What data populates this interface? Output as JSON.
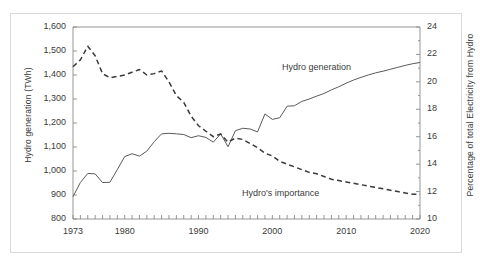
{
  "chart_data": {
    "type": "line",
    "title": "",
    "subtitle": "",
    "xlabel": "",
    "ylabel": "Hydro generation (TWh)",
    "ylabel_right": "Percentage of total Electricity from Hydro",
    "xlim": [
      1973,
      2020
    ],
    "ylim": [
      800,
      1600
    ],
    "ylim_right": [
      10,
      24
    ],
    "ytick_step": 100,
    "ytick_step_right": 2,
    "grid": false,
    "legend_position": "inline-annotation",
    "x_tick_labels": [
      "1973",
      "1980",
      "1990",
      "2000",
      "2010",
      "2020"
    ],
    "x_tick_values": [
      1973,
      1980,
      1990,
      2000,
      2010,
      2020
    ],
    "y_tick_labels_left": [
      "800",
      "900",
      "1,000",
      "1,100",
      "1,200",
      "1,300",
      "1,400",
      "1,500",
      "1,600"
    ],
    "y_tick_values_left": [
      800,
      900,
      1000,
      1100,
      1200,
      1300,
      1400,
      1500,
      1600
    ],
    "y_tick_labels_right": [
      "10",
      "12",
      "14",
      "16",
      "18",
      "20",
      "22",
      "24"
    ],
    "y_tick_values_right": [
      10,
      12,
      14,
      16,
      18,
      20,
      22,
      24
    ],
    "x": [
      1973,
      1974,
      1975,
      1976,
      1977,
      1978,
      1979,
      1980,
      1981,
      1982,
      1983,
      1984,
      1985,
      1986,
      1987,
      1988,
      1989,
      1990,
      1991,
      1992,
      1993,
      1994,
      1995,
      1996,
      1997,
      1998,
      1999,
      2000,
      2001,
      2002,
      2003,
      2004,
      2005,
      2006,
      2007,
      2008,
      2009,
      2010,
      2011,
      2012,
      2013,
      2014,
      2015,
      2016,
      2017,
      2018,
      2019,
      2020
    ],
    "series": [
      {
        "name": "Hydro generation",
        "axis": "left",
        "style": "solid",
        "color": "#5a5a5a",
        "units": "TWh",
        "values": [
          893,
          952,
          990,
          988,
          952,
          953,
          1006,
          1060,
          1072,
          1062,
          1083,
          1122,
          1155,
          1157,
          1155,
          1152,
          1139,
          1147,
          1140,
          1120,
          1155,
          1101,
          1168,
          1178,
          1175,
          1163,
          1238,
          1215,
          1222,
          1270,
          1272,
          1290,
          1300,
          1312,
          1323,
          1338,
          1351,
          1366,
          1379,
          1390,
          1400,
          1409,
          1416,
          1424,
          1432,
          1440,
          1447,
          1452
        ]
      },
      {
        "name": "Hydro's importance",
        "axis": "right",
        "style": "dashed",
        "color": "#3a3a3a",
        "units": "%",
        "values": [
          21.1,
          21.6,
          22.6,
          21.9,
          20.6,
          20.3,
          20.4,
          20.5,
          20.7,
          20.9,
          20.5,
          20.6,
          20.8,
          20.0,
          19.0,
          18.5,
          17.5,
          16.8,
          16.4,
          16.0,
          16.2,
          15.6,
          15.9,
          15.8,
          15.5,
          15.2,
          14.8,
          14.6,
          14.2,
          14.0,
          13.8,
          13.6,
          13.4,
          13.3,
          13.1,
          12.9,
          12.8,
          12.7,
          12.6,
          12.5,
          12.4,
          12.3,
          12.2,
          12.1,
          12.0,
          11.9,
          11.8,
          11.8
        ]
      }
    ],
    "annotations": [
      {
        "text": "Hydro generation",
        "series": "Hydro generation"
      },
      {
        "text": "Hydro's importance",
        "series": "Hydro's importance"
      }
    ]
  },
  "labels": {
    "ylabel_left": "Hydro generation (TWh)",
    "ylabel_right": "Percentage of total Electricity from Hydro",
    "series_generation": "Hydro generation",
    "series_importance": "Hydro's importance",
    "y_left": {
      "t800": "800",
      "t900": "900",
      "t1000": "1,000",
      "t1100": "1,100",
      "t1200": "1,200",
      "t1300": "1,300",
      "t1400": "1,400",
      "t1500": "1,500",
      "t1600": "1,600"
    },
    "y_right": {
      "t10": "10",
      "t12": "12",
      "t14": "14",
      "t16": "16",
      "t18": "18",
      "t20": "20",
      "t22": "22",
      "t24": "24"
    },
    "x": {
      "t1973": "1973",
      "t1980": "1980",
      "t1990": "1990",
      "t2000": "2000",
      "t2010": "2010",
      "t2020": "2020"
    }
  },
  "colors": {
    "frame": "#d9d9d9",
    "axis": "#7a7a7a",
    "text": "#3b3b3b",
    "solid_series": "#5a5a5a",
    "dashed_series": "#3a3a3a",
    "background": "#ffffff"
  }
}
